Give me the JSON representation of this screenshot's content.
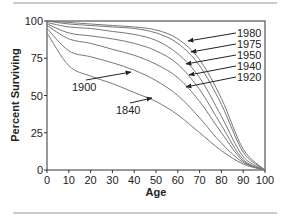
{
  "chart_data": {
    "type": "line",
    "title": "",
    "xlabel": "Age",
    "ylabel": "Percent Surviving",
    "xlim": [
      0,
      100
    ],
    "ylim": [
      0,
      100
    ],
    "x_ticks": [
      0,
      10,
      20,
      30,
      40,
      50,
      60,
      70,
      80,
      90,
      100
    ],
    "y_ticks": [
      0,
      25,
      50,
      75,
      100
    ],
    "grid": false,
    "legend": "inline arrow annotations",
    "x": [
      0,
      10,
      20,
      30,
      40,
      50,
      60,
      70,
      80,
      90,
      100
    ],
    "series": [
      {
        "name": "1840",
        "values": [
          92,
          70,
          63,
          58,
          52,
          46,
          37,
          25,
          13,
          4,
          0
        ]
      },
      {
        "name": "1900",
        "values": [
          95,
          80,
          76,
          72,
          67,
          60,
          50,
          35,
          18,
          5,
          0
        ]
      },
      {
        "name": "1920",
        "values": [
          97,
          88,
          85,
          81,
          77,
          71,
          62,
          46,
          25,
          6,
          0
        ]
      },
      {
        "name": "1940",
        "values": [
          98,
          92,
          90,
          88,
          85,
          80,
          71,
          54,
          30,
          7,
          0
        ]
      },
      {
        "name": "1950",
        "values": [
          99,
          96,
          95,
          93,
          91,
          87,
          78,
          62,
          36,
          9,
          0
        ]
      },
      {
        "name": "1975",
        "values": [
          100,
          98,
          97,
          96,
          95,
          92,
          85,
          70,
          44,
          12,
          0
        ]
      },
      {
        "name": "1980",
        "values": [
          100,
          99,
          98,
          97,
          96,
          94,
          88,
          74,
          48,
          14,
          0
        ]
      }
    ],
    "annotations": [
      {
        "text": "1980",
        "label_x": 237,
        "label_y": 37,
        "arrow_to": [
          188,
          41
        ]
      },
      {
        "text": "1975",
        "label_x": 237,
        "label_y": 48,
        "arrow_to": [
          191,
          52
        ]
      },
      {
        "text": "1950",
        "label_x": 237,
        "label_y": 59,
        "arrow_to": [
          186,
          64
        ]
      },
      {
        "text": "1940",
        "label_x": 237,
        "label_y": 70,
        "arrow_to": [
          189,
          75
        ]
      },
      {
        "text": "1920",
        "label_x": 237,
        "label_y": 81,
        "arrow_to": [
          186,
          87
        ]
      },
      {
        "text": "1900",
        "label_x": 72,
        "label_y": 91,
        "arrow_to": [
          131,
          72
        ]
      },
      {
        "text": "1840",
        "label_x": 116,
        "label_y": 114,
        "arrow_to": [
          152,
          98
        ]
      }
    ]
  }
}
